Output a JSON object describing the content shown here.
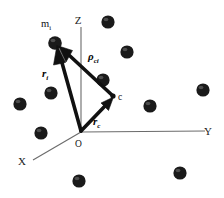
{
  "figure": {
    "background_color": "#ffffff",
    "width": 224,
    "height": 198
  },
  "axes": {
    "origin_label": "O",
    "items": [
      {
        "name": "z-axis",
        "label": "Z",
        "label_x": 78,
        "label_y": 24,
        "x1": 81,
        "y1": 27,
        "x2": 81,
        "y2": 132
      },
      {
        "name": "y-axis",
        "label": "Y",
        "label_x": 208,
        "label_y": 134,
        "x1": 81,
        "y1": 132,
        "x2": 205,
        "y2": 131
      },
      {
        "name": "x-axis",
        "label": "X",
        "label_x": 22,
        "label_y": 164,
        "x1": 81,
        "y1": 132,
        "x2": 33,
        "y2": 160
      }
    ]
  },
  "vectors": [
    {
      "name": "r-i-vector",
      "label": "r",
      "subscript": "i",
      "label_x": 45,
      "label_y": 73,
      "from_x": 81,
      "from_y": 131,
      "to_x": 57,
      "to_y": 45,
      "color": "#111111",
      "description": "position vector from origin O to particle m_i"
    },
    {
      "name": "r-c-vector",
      "label": "r",
      "subscript": "c",
      "label_x": 96,
      "label_y": 124,
      "from_x": 81,
      "from_y": 131,
      "to_x": 113,
      "to_y": 97,
      "color": "#111111",
      "description": "position vector from origin O to centre of mass c"
    },
    {
      "name": "rho-ci-vector",
      "label": "ρ",
      "subscript": "ci",
      "label_x": 89,
      "label_y": 58,
      "from_x": 113,
      "from_y": 96,
      "to_x": 59,
      "to_y": 46,
      "color": "#111111",
      "description": "relative vector from centre of mass c to particle m_i"
    }
  ],
  "points": [
    {
      "name": "mass-point-mi",
      "label": "m",
      "subscript": "i",
      "label_x": 46,
      "label_y": 24,
      "x": 55,
      "y": 43
    },
    {
      "name": "center-of-mass-point",
      "label": "c",
      "subscript": "",
      "label_x": 118,
      "label_y": 98,
      "x": 113,
      "y": 96
    },
    {
      "name": "origin-point",
      "label": "O",
      "subscript": "",
      "label_x": 77,
      "label_y": 146,
      "x": 81,
      "y": 132
    }
  ],
  "particles": [
    {
      "name": "particle-mi",
      "cx": 55,
      "cy": 43,
      "r": 6.5
    },
    {
      "name": "particle-1",
      "cx": 108,
      "cy": 22,
      "r": 6.5
    },
    {
      "name": "particle-2",
      "cx": 127,
      "cy": 52,
      "r": 6.5
    },
    {
      "name": "particle-3",
      "cx": 103,
      "cy": 80,
      "r": 6.5
    },
    {
      "name": "particle-4",
      "cx": 51,
      "cy": 93,
      "r": 6.5
    },
    {
      "name": "particle-5",
      "cx": 20,
      "cy": 104,
      "r": 6.5
    },
    {
      "name": "particle-6",
      "cx": 150,
      "cy": 106,
      "r": 6.5
    },
    {
      "name": "particle-7",
      "cx": 203,
      "cy": 90,
      "r": 6.5
    },
    {
      "name": "particle-8",
      "cx": 41,
      "cy": 133,
      "r": 6.5
    },
    {
      "name": "particle-9",
      "cx": 79,
      "cy": 181,
      "r": 6.5
    },
    {
      "name": "particle-10",
      "cx": 180,
      "cy": 173,
      "r": 6.5
    }
  ]
}
